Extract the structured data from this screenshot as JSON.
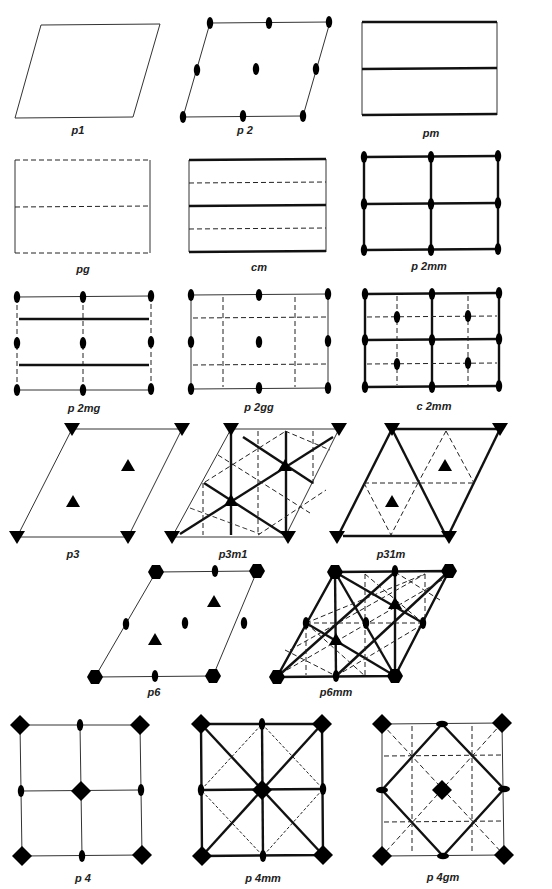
{
  "legend": {
    "thin_line": "unit cell edge",
    "thick_line": "mirror line",
    "dashed_line": "glide reflection line",
    "ellipse": "2-fold rotation center",
    "triangle": "3-fold rotation center",
    "square": "4-fold rotation center",
    "hexagon": "6-fold rotation center"
  },
  "groups": [
    {
      "id": "p1",
      "label": "p1",
      "lattice": "oblique"
    },
    {
      "id": "p2",
      "label": "p 2",
      "lattice": "oblique"
    },
    {
      "id": "pm",
      "label": "pm",
      "lattice": "rectangular"
    },
    {
      "id": "pg",
      "label": "pg",
      "lattice": "rectangular"
    },
    {
      "id": "cm",
      "label": "cm",
      "lattice": "centered rectangular"
    },
    {
      "id": "p2mm",
      "label": "p 2mm",
      "lattice": "rectangular"
    },
    {
      "id": "p2mg",
      "label": "p 2mg",
      "lattice": "rectangular"
    },
    {
      "id": "p2gg",
      "label": "p 2gg",
      "lattice": "rectangular"
    },
    {
      "id": "c2mm",
      "label": "c 2mm",
      "lattice": "centered rectangular"
    },
    {
      "id": "p3",
      "label": "p3",
      "lattice": "hexagonal"
    },
    {
      "id": "p3m1",
      "label": "p3m1",
      "lattice": "hexagonal"
    },
    {
      "id": "p31m",
      "label": "p31m",
      "lattice": "hexagonal"
    },
    {
      "id": "p6",
      "label": "p6",
      "lattice": "hexagonal"
    },
    {
      "id": "p6mm",
      "label": "p6mm",
      "lattice": "hexagonal"
    },
    {
      "id": "p4",
      "label": "p 4",
      "lattice": "square"
    },
    {
      "id": "p4mm",
      "label": "p 4mm",
      "lattice": "square"
    },
    {
      "id": "p4gm",
      "label": "p 4gm",
      "lattice": "square"
    }
  ]
}
